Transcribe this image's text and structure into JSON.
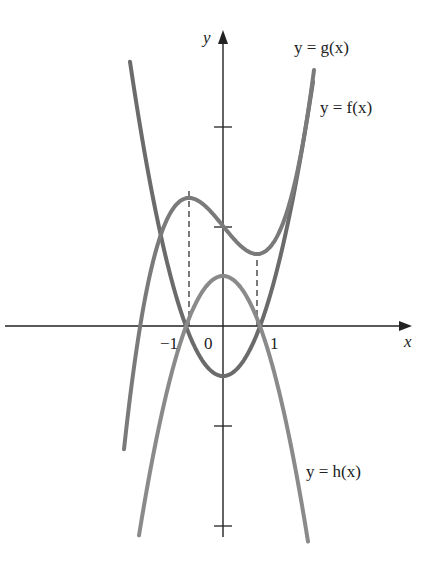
{
  "figure": {
    "axes": {
      "x_label": "x",
      "y_label": "y",
      "tick_labels": [
        "-1",
        "0",
        "1"
      ]
    },
    "curves": [
      {
        "name": "g",
        "label": "y = g(x)",
        "color": "#6b6b6b",
        "description": "upward parabola, minimum below origin, zeros at the two critical points of f"
      },
      {
        "name": "f",
        "label": "y = f(x)",
        "color": "#7a7a7a",
        "description": "cubic with local max and local min"
      },
      {
        "name": "h",
        "label": "y = h(x)",
        "color": "#8a8a8a",
        "description": "downward parabola, maximum above origin, zeros at same points as g"
      }
    ],
    "annotations": {
      "dashed_lines": "vertical dashed lines from f's local max and local min down to x-axis"
    },
    "colors": {
      "axis": "#222222",
      "dashed": "#333333",
      "background": "#ffffff"
    }
  },
  "labels": {
    "g": "y = g(x)",
    "f": "y = f(x)",
    "h": "y = h(x)",
    "x": "x",
    "y": "y",
    "neg_one": "−1",
    "zero": "0",
    "one": "1"
  }
}
